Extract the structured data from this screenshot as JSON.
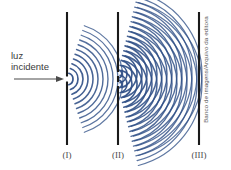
{
  "figure": {
    "type": "physics-diagram",
    "background_color": "#ffffff",
    "wave_color": "#2f4f86",
    "wave_color_light": "#7f9ac4",
    "barrier_color": "#1a1a1a",
    "arrow_color": "#4a4a4a"
  },
  "annotations": {
    "incident_light_line1": "luz",
    "incident_light_line2": "incidente",
    "arrow_label": "incident-light-arrow"
  },
  "barriers": [
    {
      "id": "I",
      "label": "(I)",
      "x": 67,
      "y_top": 12,
      "y_bottom": 145,
      "slits": [
        {
          "y": 79,
          "gap": 5
        }
      ]
    },
    {
      "id": "II",
      "label": "(II)",
      "x": 118,
      "y_top": 12,
      "y_bottom": 145,
      "slits": [
        {
          "y": 74,
          "gap": 4
        },
        {
          "y": 84,
          "gap": 4
        }
      ]
    },
    {
      "id": "III",
      "label": "(III)",
      "x": 199,
      "y_top": 12,
      "y_bottom": 145,
      "slits": []
    }
  ],
  "wave_sources": [
    {
      "name": "single-slit-source",
      "cx": 67,
      "cy": 79,
      "arcs": 11,
      "spacing": 5.0,
      "start_radius": 6,
      "half_angle_deg": 72
    },
    {
      "name": "double-slit-source-upper",
      "cx": 118,
      "cy": 74,
      "arcs": 17,
      "spacing": 5.0,
      "start_radius": 4,
      "half_angle_deg": 76
    },
    {
      "name": "double-slit-source-lower",
      "cx": 118,
      "cy": 84,
      "arcs": 17,
      "spacing": 5.0,
      "start_radius": 4,
      "half_angle_deg": 76
    }
  ],
  "credit": {
    "text": "Banco de imagens/Arquivo da editora"
  }
}
